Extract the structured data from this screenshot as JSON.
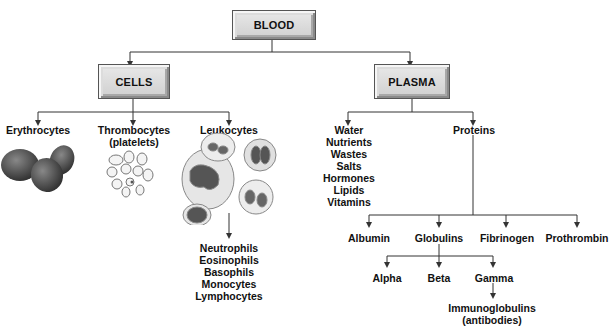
{
  "diagram": {
    "root": {
      "label": "BLOOD"
    },
    "branches": {
      "cells": {
        "label": "CELLS",
        "children": [
          {
            "label": "Erythrocytes",
            "illustration": "red-blood-cells"
          },
          {
            "label": "Thrombocytes",
            "sublabel": "(platelets)",
            "illustration": "platelets"
          },
          {
            "label": "Leukocytes",
            "illustration": "white-blood-cells",
            "types": [
              "Neutrophils",
              "Eosinophils",
              "Basophils",
              "Monocytes",
              "Lymphocytes"
            ]
          }
        ]
      },
      "plasma": {
        "label": "PLASMA",
        "components": [
          "Water",
          "Nutrients",
          "Wastes",
          "Salts",
          "Hormones",
          "Lipids",
          "Vitamins"
        ],
        "proteins": {
          "label": "Proteins",
          "children": [
            {
              "label": "Albumin"
            },
            {
              "label": "Globulins",
              "children": [
                {
                  "label": "Alpha"
                },
                {
                  "label": "Beta"
                },
                {
                  "label": "Gamma",
                  "child": {
                    "label": "Immunoglobulins",
                    "sublabel": "(antibodies)"
                  }
                }
              ]
            },
            {
              "label": "Fibrinogen"
            },
            {
              "label": "Prothrombin"
            }
          ]
        }
      }
    },
    "colors": {
      "line": "#333333",
      "box_fill": "#d8d8d8",
      "box_border": "#555555"
    }
  }
}
